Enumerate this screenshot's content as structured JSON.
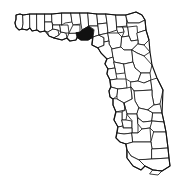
{
  "figure": {
    "type": "locator-map",
    "region": "Florida",
    "subdivision_type": "county",
    "background_color": "#ffffff",
    "outline_color": "#111111",
    "county_fill_color": "#ffffff",
    "highlight_fill_color": "#111111",
    "highlighted_county": "Taylor County",
    "highlighted_county_position": "Big Bend / Gulf Coast, north Florida",
    "title": "",
    "labels": [],
    "legend": [],
    "visible_text": ""
  },
  "map": {
    "width": 193,
    "height": 183,
    "highlight_bbox": {
      "x": 77,
      "y": 30,
      "width": 17,
      "height": 11
    }
  }
}
